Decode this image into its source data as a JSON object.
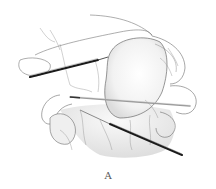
{
  "figure": {
    "caption": "A",
    "colors": {
      "line": "#6b6b6b",
      "shade": "#e6e6e6",
      "instrument_dark": "#1a1a1a",
      "instrument_light": "#8a8a8a"
    }
  }
}
